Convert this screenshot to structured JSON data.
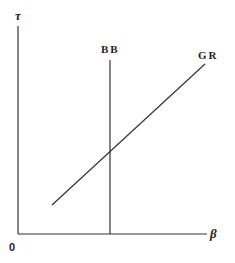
{
  "diagram": {
    "axes": {
      "y_label": "τ",
      "x_label": "β",
      "origin_label": "0"
    },
    "curves": [
      {
        "id": "bb",
        "label": "BB",
        "type": "vertical-line"
      },
      {
        "id": "gr",
        "label": "GR",
        "type": "upward-sloping-line"
      }
    ],
    "colors": {
      "line": "#333333",
      "text": "#222222",
      "background": "#ffffff"
    }
  }
}
